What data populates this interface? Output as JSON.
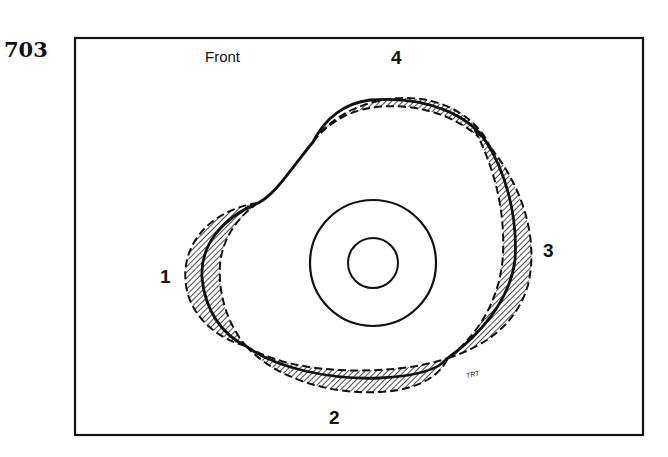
{
  "figure": {
    "number": "703",
    "orientation_label": "Front",
    "position_labels": {
      "p1": "1",
      "p2": "2",
      "p3": "3",
      "p4": "4"
    },
    "signature": "TRT"
  },
  "colors": {
    "ink": "#111111",
    "background": "#ffffff",
    "hatch": "#222222"
  }
}
